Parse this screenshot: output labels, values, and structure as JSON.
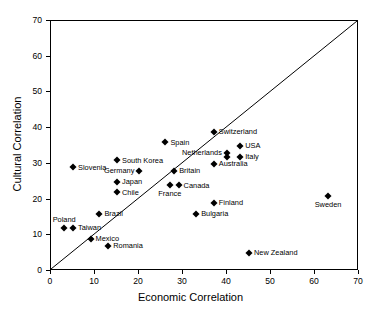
{
  "chart_data": {
    "type": "scatter",
    "title": "",
    "xlabel": "Economic Correlation",
    "ylabel": "Cultural Correlation",
    "xlim": [
      0,
      70
    ],
    "ylim": [
      0,
      70
    ],
    "xticks": [
      0,
      10,
      20,
      30,
      40,
      50,
      60,
      70
    ],
    "yticks": [
      0,
      10,
      20,
      30,
      40,
      50,
      60,
      70
    ],
    "grid": false,
    "legend": "none",
    "annotations": [
      {
        "name": "identity-line",
        "type": "line",
        "description": "45 degree reference line from (0,0) to (70,70)"
      }
    ],
    "points": [
      {
        "label": "Switzerland",
        "x": 37,
        "y": 39,
        "label_pos": "right"
      },
      {
        "label": "Spain",
        "x": 26,
        "y": 36,
        "label_pos": "right"
      },
      {
        "label": "USA",
        "x": 43,
        "y": 35,
        "label_pos": "right"
      },
      {
        "label": "Netherlands",
        "x": 40,
        "y": 33,
        "label_pos": "left"
      },
      {
        "label": "Italy",
        "x": 43,
        "y": 32,
        "label_pos": "right"
      },
      {
        "label": "",
        "x": 40,
        "y": 32,
        "label_pos": "none"
      },
      {
        "label": "South Korea",
        "x": 15,
        "y": 31,
        "label_pos": "right"
      },
      {
        "label": "Australia",
        "x": 37,
        "y": 30,
        "label_pos": "right"
      },
      {
        "label": "Slovenia",
        "x": 5,
        "y": 29,
        "label_pos": "right"
      },
      {
        "label": "Germany",
        "x": 20,
        "y": 28,
        "label_pos": "left"
      },
      {
        "label": "Britain",
        "x": 28,
        "y": 28,
        "label_pos": "right"
      },
      {
        "label": "Japan",
        "x": 15,
        "y": 25,
        "label_pos": "right"
      },
      {
        "label": "Canada",
        "x": 29,
        "y": 24,
        "label_pos": "right"
      },
      {
        "label": "France",
        "x": 27,
        "y": 24,
        "label_pos": "below"
      },
      {
        "label": "Chile",
        "x": 15,
        "y": 22,
        "label_pos": "right"
      },
      {
        "label": "Sweden",
        "x": 63,
        "y": 21,
        "label_pos": "below"
      },
      {
        "label": "Finland",
        "x": 37,
        "y": 19,
        "label_pos": "right"
      },
      {
        "label": "Brazil",
        "x": 11,
        "y": 16,
        "label_pos": "right"
      },
      {
        "label": "Bulgaria",
        "x": 33,
        "y": 16,
        "label_pos": "right"
      },
      {
        "label": "Poland",
        "x": 3,
        "y": 12,
        "label_pos": "above"
      },
      {
        "label": "Taiwan",
        "x": 5,
        "y": 12,
        "label_pos": "right"
      },
      {
        "label": "Mexico",
        "x": 9,
        "y": 9,
        "label_pos": "right"
      },
      {
        "label": "Romania",
        "x": 13,
        "y": 7,
        "label_pos": "right"
      },
      {
        "label": "New Zealand",
        "x": 45,
        "y": 5,
        "label_pos": "right"
      }
    ]
  },
  "axes": {
    "x_label": "Economic Correlation",
    "y_label": "Cultural Correlation",
    "x_tick_labels": [
      "0",
      "10",
      "20",
      "30",
      "40",
      "50",
      "60",
      "70"
    ],
    "y_tick_labels": [
      "0",
      "10",
      "20",
      "30",
      "40",
      "50",
      "60",
      "70"
    ]
  },
  "colors": {
    "marker": "#000000",
    "axis": "#000000",
    "background": "#ffffff",
    "line": "#000000"
  }
}
